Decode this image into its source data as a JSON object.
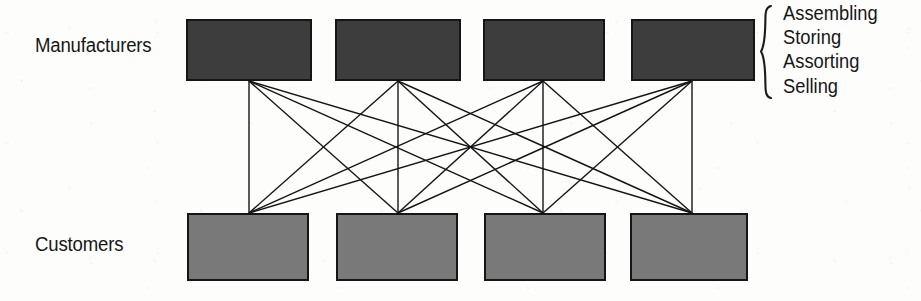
{
  "diagram": {
    "background_color": "#fdfdfb",
    "rows": [
      {
        "id": "manufacturers",
        "label": "Manufacturers",
        "node_count": 4,
        "fill_color": "#3d3d3d",
        "border_color": "#151515"
      },
      {
        "id": "customers",
        "label": "Customers",
        "node_count": 4,
        "fill_color": "#797979",
        "border_color": "#151515"
      }
    ],
    "links": {
      "type": "complete-bipartite",
      "count": 16,
      "line_color": "#141414",
      "line_width": 1.4,
      "description": "Every manufacturer connects to every customer"
    },
    "annotation": {
      "brace": "{",
      "items": [
        "Assembling",
        "Storing",
        "Assorting",
        "Selling"
      ]
    },
    "geometry": {
      "top_boxes": [
        {
          "x": 186,
          "y": 19,
          "w": 126,
          "h": 62
        },
        {
          "x": 335,
          "y": 19,
          "w": 126,
          "h": 62
        },
        {
          "x": 483,
          "y": 19,
          "w": 122,
          "h": 62
        },
        {
          "x": 631,
          "y": 19,
          "w": 124,
          "h": 62
        }
      ],
      "bottom_boxes": [
        {
          "x": 187,
          "y": 213,
          "w": 122,
          "h": 68
        },
        {
          "x": 336,
          "y": 213,
          "w": 122,
          "h": 68
        },
        {
          "x": 484,
          "y": 213,
          "w": 122,
          "h": 68
        },
        {
          "x": 630,
          "y": 213,
          "w": 118,
          "h": 68
        }
      ],
      "top_nodes_x": [
        249,
        398,
        543,
        692
      ],
      "bottom_nodes_x": [
        249,
        398,
        543,
        692
      ],
      "top_nodes_y": 81,
      "bottom_nodes_y": 213
    }
  }
}
